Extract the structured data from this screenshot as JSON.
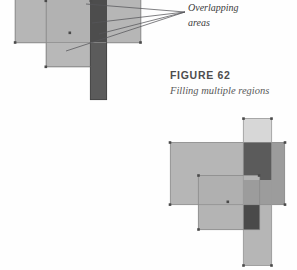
{
  "page": {
    "background_color": "#fefefe",
    "width": 297,
    "height": 270
  },
  "caption": {
    "figure_label": "FIGURE 62",
    "description": "Filling multiple regions"
  },
  "annotation": {
    "line1": "Overlapping",
    "line2": "areas",
    "leader_origin": {
      "x": 185,
      "y": 12
    },
    "leader_targets": [
      {
        "x": 86,
        "y": 5
      },
      {
        "x": 92,
        "y": 23
      },
      {
        "x": 98,
        "y": 34
      },
      {
        "x": 66,
        "y": 51
      }
    ]
  },
  "palette": {
    "light_fill": "#d7d7d7",
    "base_fill": "#b6b6b6",
    "mid_fill": "#9c9c9c",
    "dark_fill": "#5b5b5b",
    "darkest_fill": "#4a4a4a",
    "outline": "#8a8a8a",
    "handle": "#4a4a4a",
    "leader_line": "#55555a"
  },
  "diagrams": [
    {
      "name": "top-diagram",
      "shapes": [
        {
          "id": "top-horizontal-band",
          "role": "horizontal-rectangle",
          "x": 15,
          "y": -8,
          "w": 126,
          "h": 51,
          "fill": "#b6b6b6"
        },
        {
          "id": "top-square",
          "role": "square-region",
          "x": 46,
          "y": -6,
          "w": 45,
          "h": 73,
          "fill": "#b6b6b6"
        },
        {
          "id": "top-vertical-strip",
          "role": "vertical-strip",
          "x": 90,
          "y": -8,
          "w": 17,
          "h": 108,
          "fill": "#5b5b5b"
        },
        {
          "id": "top-overlap-band-strip",
          "role": "overlap",
          "x": 90,
          "y": -8,
          "w": 17,
          "h": 51,
          "fill": "#4a4a4a"
        }
      ],
      "handles": [
        {
          "x": 46,
          "y": 1
        },
        {
          "x": 91,
          "y": 1
        },
        {
          "x": 46,
          "y": 67
        },
        {
          "x": 70,
          "y": 33
        },
        {
          "x": 15,
          "y": 42
        },
        {
          "x": 140,
          "y": 42
        }
      ]
    },
    {
      "name": "bottom-diagram",
      "shapes": [
        {
          "id": "bottom-vertical-strip",
          "role": "vertical-strip",
          "x": 243,
          "y": 118,
          "w": 29,
          "h": 148,
          "fill": "#b6b6b6"
        },
        {
          "id": "bottom-strip-top",
          "role": "strip-segment",
          "x": 243,
          "y": 118,
          "w": 29,
          "h": 25,
          "fill": "#d7d7d7"
        },
        {
          "id": "bottom-horizontal-band",
          "role": "horizontal-rectangle",
          "x": 170,
          "y": 142,
          "w": 115,
          "h": 63,
          "fill": "#b6b6b6"
        },
        {
          "id": "bottom-band-right",
          "role": "band-segment",
          "x": 243,
          "y": 142,
          "w": 42,
          "h": 63,
          "fill": "#9c9c9c"
        },
        {
          "id": "bottom-square",
          "role": "square-region",
          "x": 198,
          "y": 175,
          "w": 62,
          "h": 55,
          "fill": "#b6b6b6"
        },
        {
          "id": "bottom-overlap-strip-band",
          "role": "overlap",
          "x": 243,
          "y": 142,
          "w": 29,
          "h": 38,
          "fill": "#5b5b5b"
        },
        {
          "id": "bottom-overlap-strip-square",
          "role": "overlap",
          "x": 243,
          "y": 205,
          "w": 17,
          "h": 25,
          "fill": "#4a4a4a"
        }
      ],
      "handles": [
        {
          "x": 170,
          "y": 143
        },
        {
          "x": 285,
          "y": 143
        },
        {
          "x": 170,
          "y": 204
        },
        {
          "x": 285,
          "y": 204
        },
        {
          "x": 244,
          "y": 119
        },
        {
          "x": 271,
          "y": 119
        },
        {
          "x": 244,
          "y": 265
        },
        {
          "x": 271,
          "y": 265
        },
        {
          "x": 199,
          "y": 176
        },
        {
          "x": 259,
          "y": 176
        },
        {
          "x": 199,
          "y": 229
        },
        {
          "x": 228,
          "y": 202
        }
      ]
    }
  ]
}
